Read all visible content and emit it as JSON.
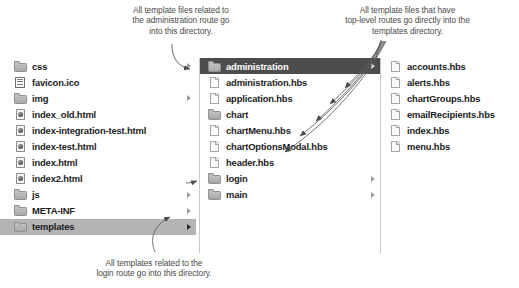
{
  "annotations": {
    "administration": "All template files related to\nthe administration route go\ninto this directory.",
    "top_level": "All template files that have\ntop-level routes go directly into the\ntemplates directory.",
    "login": "All templates related to the\nlogin route go into this directory."
  },
  "colors": {
    "selected_dark": "#4d4d4d",
    "selected_light": "#b4b4b4",
    "text": "#1b1b1b",
    "annotation_text": "#4a4a4a",
    "column_divider": "#c9c9c9",
    "background": "#ffffff"
  },
  "columns": [
    {
      "name": "project-root-column",
      "items": [
        {
          "label": "css",
          "icon": "folder-icon",
          "type": "folder",
          "disclosure": true,
          "selected": "none"
        },
        {
          "label": "favicon.ico",
          "icon": "document-lines-icon",
          "type": "file",
          "disclosure": false,
          "selected": "none"
        },
        {
          "label": "img",
          "icon": "folder-icon",
          "type": "folder",
          "disclosure": true,
          "selected": "none"
        },
        {
          "label": "index_old.html",
          "icon": "html-file-icon",
          "type": "file",
          "disclosure": false,
          "selected": "none"
        },
        {
          "label": "index-integration-test.html",
          "icon": "html-file-icon",
          "type": "file",
          "disclosure": false,
          "selected": "none"
        },
        {
          "label": "index-test.html",
          "icon": "html-file-icon",
          "type": "file",
          "disclosure": false,
          "selected": "none"
        },
        {
          "label": "index.html",
          "icon": "html-file-icon",
          "type": "file",
          "disclosure": false,
          "selected": "none"
        },
        {
          "label": "index2.html",
          "icon": "html-file-icon",
          "type": "file",
          "disclosure": false,
          "selected": "none"
        },
        {
          "label": "js",
          "icon": "folder-icon",
          "type": "folder",
          "disclosure": true,
          "selected": "none"
        },
        {
          "label": "META-INF",
          "icon": "folder-icon",
          "type": "folder",
          "disclosure": true,
          "selected": "none"
        },
        {
          "label": "templates",
          "icon": "folder-icon",
          "type": "folder",
          "disclosure": true,
          "selected": "light"
        }
      ]
    },
    {
      "name": "templates-column",
      "items": [
        {
          "label": "administration",
          "icon": "folder-icon",
          "type": "folder",
          "disclosure": true,
          "selected": "dark"
        },
        {
          "label": "administration.hbs",
          "icon": "document-icon",
          "type": "file",
          "disclosure": false,
          "selected": "none"
        },
        {
          "label": "application.hbs",
          "icon": "document-icon",
          "type": "file",
          "disclosure": false,
          "selected": "none"
        },
        {
          "label": "chart",
          "icon": "folder-icon",
          "type": "folder",
          "disclosure": false,
          "selected": "none"
        },
        {
          "label": "chartMenu.hbs",
          "icon": "document-icon",
          "type": "file",
          "disclosure": false,
          "selected": "none"
        },
        {
          "label": "chartOptionsModal.hbs",
          "icon": "document-icon",
          "type": "file",
          "disclosure": false,
          "selected": "none"
        },
        {
          "label": "header.hbs",
          "icon": "document-icon",
          "type": "file",
          "disclosure": false,
          "selected": "none"
        },
        {
          "label": "login",
          "icon": "folder-icon",
          "type": "folder",
          "disclosure": true,
          "selected": "none"
        },
        {
          "label": "main",
          "icon": "folder-icon",
          "type": "folder",
          "disclosure": true,
          "selected": "none"
        }
      ]
    },
    {
      "name": "administration-column",
      "items": [
        {
          "label": "accounts.hbs",
          "icon": "document-icon",
          "type": "file",
          "disclosure": false,
          "selected": "none"
        },
        {
          "label": "alerts.hbs",
          "icon": "document-icon",
          "type": "file",
          "disclosure": false,
          "selected": "none"
        },
        {
          "label": "chartGroups.hbs",
          "icon": "document-icon",
          "type": "file",
          "disclosure": false,
          "selected": "none"
        },
        {
          "label": "emailRecipients.hbs",
          "icon": "document-icon",
          "type": "file",
          "disclosure": false,
          "selected": "none"
        },
        {
          "label": "index.hbs",
          "icon": "document-icon",
          "type": "file",
          "disclosure": false,
          "selected": "none"
        },
        {
          "label": "menu.hbs",
          "icon": "document-icon",
          "type": "file",
          "disclosure": false,
          "selected": "none"
        }
      ]
    }
  ]
}
